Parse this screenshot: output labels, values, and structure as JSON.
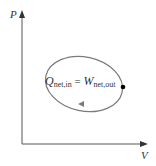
{
  "diagram": {
    "type": "pv-cycle",
    "axes": {
      "y_label": "P",
      "x_label": "V"
    },
    "equation": {
      "lhs_symbol": "Q",
      "lhs_subscript": "net,in",
      "equals": "=",
      "rhs_symbol": "W",
      "rhs_subscript": "net,out"
    },
    "cycle": {
      "shape": "ellipse",
      "direction": "clockwise",
      "stroke_color": "#7a7a7a",
      "state_point_color": "#000000"
    },
    "axis_color": "#555555"
  }
}
